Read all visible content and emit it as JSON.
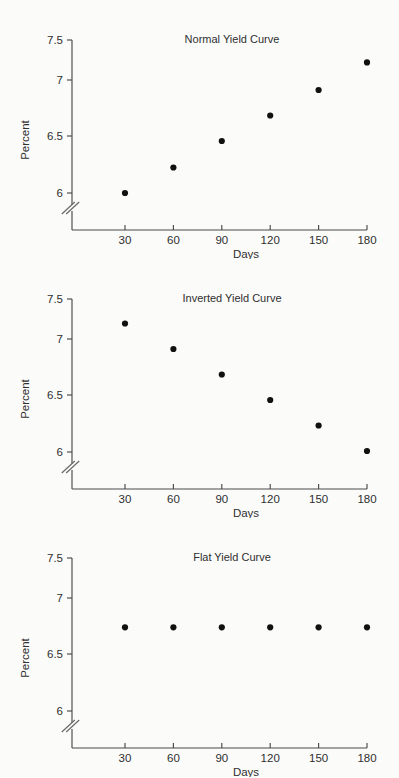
{
  "figure": {
    "background_color": "#fbfbfa",
    "ink_color": "#2b2b2b",
    "point_color": "#111111"
  },
  "axis": {
    "y_label": "Percent",
    "x_label": "Days",
    "y_ticks": [
      "7.5",
      "7",
      "6.5",
      "6"
    ],
    "x_ticks": [
      "30",
      "60",
      "90",
      "120",
      "150",
      "180"
    ],
    "break_symbol": "axis-break-double-slash"
  },
  "panels": [
    {
      "title": "Normal Yield Curve"
    },
    {
      "title": "Inverted Yield Curve"
    },
    {
      "title": "Flat Yield Curve"
    }
  ],
  "chart_data": [
    {
      "type": "scatter",
      "title": "Normal Yield Curve",
      "xlabel": "Days",
      "ylabel": "Percent",
      "x": [
        30,
        60,
        90,
        120,
        150,
        180
      ],
      "values": [
        6.0,
        6.25,
        6.51,
        6.76,
        7.01,
        7.28
      ],
      "xlim": [
        0,
        195
      ],
      "ylim": [
        5.75,
        7.5
      ],
      "yticks": [
        6,
        6.5,
        7,
        7.5
      ],
      "ytick_labels": [
        "6",
        "6.5",
        "7",
        "7.5"
      ],
      "xticks": [
        30,
        60,
        90,
        120,
        150,
        180
      ],
      "xtick_labels": [
        "30",
        "60",
        "90",
        "120",
        "150",
        "180"
      ],
      "grid": false,
      "legend": "none",
      "axis_break": "y-axis below 6"
    },
    {
      "type": "scatter",
      "title": "Inverted Yield Curve",
      "xlabel": "Days",
      "ylabel": "Percent",
      "x": [
        30,
        60,
        90,
        120,
        150,
        180
      ],
      "values": [
        7.26,
        7.01,
        6.76,
        6.51,
        6.26,
        6.01
      ],
      "xlim": [
        0,
        195
      ],
      "ylim": [
        5.75,
        7.5
      ],
      "yticks": [
        6,
        6.5,
        7,
        7.5
      ],
      "ytick_labels": [
        "6",
        "6.5",
        "7",
        "7.5"
      ],
      "xticks": [
        30,
        60,
        90,
        120,
        150,
        180
      ],
      "xtick_labels": [
        "30",
        "60",
        "90",
        "120",
        "150",
        "180"
      ],
      "grid": false,
      "legend": "none",
      "axis_break": "y-axis below 6"
    },
    {
      "type": "scatter",
      "title": "Flat Yield Curve",
      "xlabel": "Days",
      "ylabel": "Percent",
      "x": [
        30,
        60,
        90,
        120,
        150,
        180
      ],
      "values": [
        6.82,
        6.82,
        6.82,
        6.82,
        6.82,
        6.82
      ],
      "xlim": [
        0,
        195
      ],
      "ylim": [
        5.75,
        7.5
      ],
      "yticks": [
        6,
        6.5,
        7,
        7.5
      ],
      "ytick_labels": [
        "6",
        "6.5",
        "7",
        "7.5"
      ],
      "xticks": [
        30,
        60,
        90,
        120,
        150,
        180
      ],
      "xtick_labels": [
        "30",
        "60",
        "90",
        "120",
        "150",
        "180"
      ],
      "grid": false,
      "legend": "none",
      "axis_break": "y-axis below 6"
    }
  ]
}
